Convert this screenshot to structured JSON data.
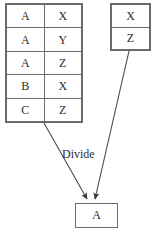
{
  "diagram": {
    "type": "relational-divide-diagram",
    "background_color": "#ffffff",
    "line_color": "#4a4a4a",
    "border_color": "#6b6b6b",
    "text_color": "#2b2b2b",
    "dividend_table": {
      "name": "dividend-relation",
      "columns": 2,
      "rows": [
        [
          "A",
          "X"
        ],
        [
          "A",
          "Y"
        ],
        [
          "A",
          "Z"
        ],
        [
          "B",
          "X"
        ],
        [
          "C",
          "Z"
        ]
      ]
    },
    "divisor_table": {
      "name": "divisor-relation",
      "columns": 1,
      "rows": [
        [
          "X"
        ],
        [
          "Z"
        ]
      ]
    },
    "result_table": {
      "name": "quotient-relation",
      "columns": 1,
      "rows": [
        [
          "A"
        ]
      ]
    },
    "operation_label": "Divide"
  }
}
